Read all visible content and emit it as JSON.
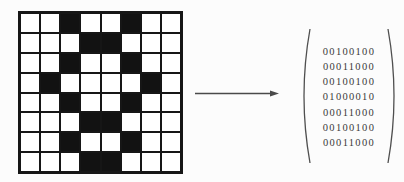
{
  "grid": {
    "cols": 8,
    "rows_count": 8,
    "rows": [
      "00100100",
      "00011000",
      "00100100",
      "01000010",
      "00100100",
      "00011000",
      "00100100",
      "00011000"
    ],
    "cell_black_color": "#121212",
    "line_color": "#161616",
    "cell_white_color": "#ffffff"
  },
  "arrow": {
    "direction": "right",
    "color": "#4a4a4a"
  },
  "matrix": {
    "rows": [
      "00100100",
      "00011000",
      "00100100",
      "01000010",
      "00011000",
      "00100100",
      "00011000"
    ],
    "text_color": "#3a3a3a",
    "paren_color": "#4f4f4f"
  }
}
